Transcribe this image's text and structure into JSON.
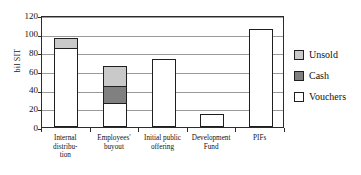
{
  "chart_data": {
    "type": "bar",
    "subtype": "stacked-vertical",
    "title": "",
    "xlabel": "",
    "ylabel": "bil SIT",
    "ylim": [
      0,
      120
    ],
    "yticks": [
      0,
      20,
      40,
      60,
      80,
      100,
      120
    ],
    "ytick_labels": [
      "0",
      "20",
      "40",
      "60",
      "80",
      "100",
      "120"
    ],
    "grid": true,
    "grid_axis": "y",
    "legend_position": "right",
    "categories": [
      "Internal distribution",
      "Employees' buyout",
      "Initial public offering",
      "Development Fund",
      "PIFs"
    ],
    "category_lines": [
      [
        "Internal",
        "distribu-",
        "tion"
      ],
      [
        "Employees'",
        "buyout"
      ],
      [
        "Initial public",
        "offering"
      ],
      [
        "Development",
        "Fund"
      ],
      [
        "PIFs"
      ]
    ],
    "series": [
      {
        "name": "Vouchers",
        "color": "#ffffff",
        "values": [
          86,
          25,
          73,
          13.5,
          105
        ]
      },
      {
        "name": "Cash",
        "color": "#808080",
        "values": [
          0,
          19,
          0,
          0,
          0
        ]
      },
      {
        "name": "Unsold",
        "color": "#c9c9c9",
        "values": [
          9,
          21,
          0,
          0,
          0
        ]
      }
    ],
    "totals": [
      95,
      65,
      73,
      13.5,
      105
    ],
    "stack_order_bottom_to_top": [
      "Vouchers",
      "Cash",
      "Unsold"
    ]
  },
  "legend": {
    "items": [
      {
        "label": "Unsold",
        "color": "#c9c9c9"
      },
      {
        "label": "Cash",
        "color": "#808080"
      },
      {
        "label": "Vouchers",
        "color": "#ffffff"
      }
    ]
  },
  "axis": {
    "y_title": "bil SIT"
  }
}
